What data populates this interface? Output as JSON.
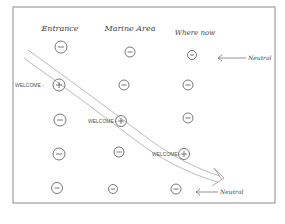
{
  "diagram": {
    "columns": [
      {
        "label": "Entrance",
        "x": 60
      },
      {
        "label": "Marine Area",
        "x": 130
      },
      {
        "label": "Where now",
        "x": 193
      }
    ],
    "rows_y": [
      47,
      85,
      120,
      155,
      188
    ],
    "cells": [
      [
        "−",
        "−",
        "−"
      ],
      [
        "+",
        "−",
        "−"
      ],
      [
        "−",
        "+",
        "−"
      ],
      [
        "−",
        "−",
        "+"
      ],
      [
        "−",
        "−",
        "−"
      ]
    ],
    "welcome_labels": [
      {
        "text": "WELCOME -",
        "row": 1,
        "col": 0
      },
      {
        "text": "WELCOME -",
        "row": 2,
        "col": 1
      },
      {
        "text": "WELCOME -",
        "row": 3,
        "col": 2
      }
    ],
    "annotations": [
      {
        "text": "Neutral",
        "row": 0,
        "arrow": "←"
      },
      {
        "text": "Neutral",
        "row": 4,
        "arrow": "←"
      }
    ],
    "path_arrow": {
      "description": "double-line arrow from top-left to bottom-right through the + cells"
    },
    "colors": {
      "ink": "#555555",
      "frame": "#888888",
      "paper": "#ffffff"
    }
  }
}
